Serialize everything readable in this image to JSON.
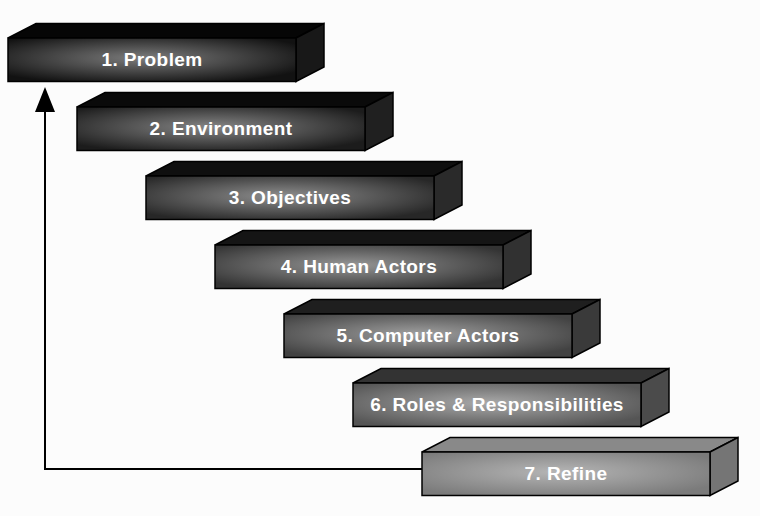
{
  "diagram": {
    "background_color": "#fcfcfc",
    "text_color": "#ffffff",
    "arrow_color": "#000000",
    "steps": [
      {
        "label": "1. Problem",
        "front": "#121212",
        "highlight": "#7c7c7c",
        "top": "#060606",
        "side": "#181818"
      },
      {
        "label": "2. Environment",
        "front": "#1c1c1c",
        "highlight": "#858585",
        "top": "#0a0a0a",
        "side": "#202020"
      },
      {
        "label": "3. Objectives",
        "front": "#272727",
        "highlight": "#8e8e8e",
        "top": "#0f0f0f",
        "side": "#2a2a2a"
      },
      {
        "label": "4. Human Actors",
        "front": "#333333",
        "highlight": "#969696",
        "top": "#151515",
        "side": "#313131"
      },
      {
        "label": "5. Computer Actors",
        "front": "#424242",
        "highlight": "#9f9f9f",
        "top": "#1f1f1f",
        "side": "#3a3a3a"
      },
      {
        "label": "6. Roles & Responsibilities",
        "front": "#555555",
        "highlight": "#a9a9a9",
        "top": "#333333",
        "side": "#4b4b4b"
      },
      {
        "label": "7. Refine",
        "front": "#7b7b7b",
        "highlight": "#b5b5b5",
        "top": "#898989",
        "side": "#757575"
      }
    ]
  }
}
